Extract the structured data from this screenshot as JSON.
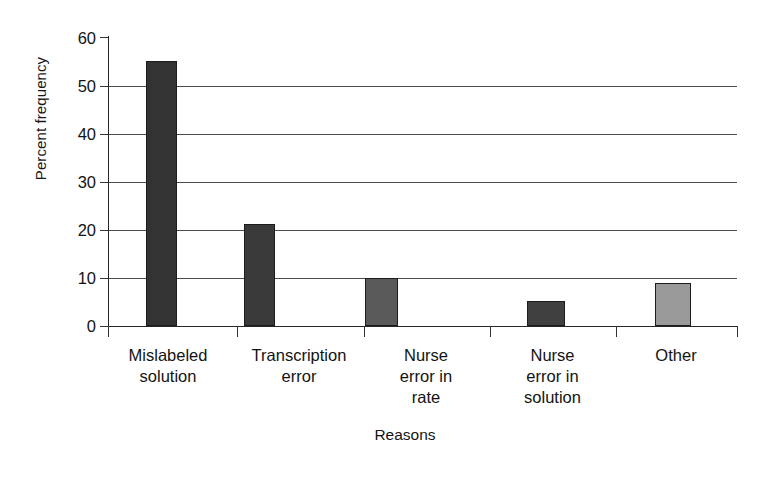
{
  "chart_data": {
    "type": "bar",
    "title": "",
    "xlabel": "Reasons",
    "ylabel": "Percent frequency",
    "categories": [
      "Mislabeled solution",
      "Transcription error",
      "Nurse error in rate",
      "Nurse error in solution",
      "Other"
    ],
    "category_lines": [
      [
        "Mislabeled",
        "solution"
      ],
      [
        "Transcription",
        "error"
      ],
      [
        "Nurse",
        "error in",
        "rate"
      ],
      [
        "Nurse",
        "error in",
        "solution"
      ],
      [
        "Other"
      ]
    ],
    "values": [
      55,
      21.2,
      10,
      5.1,
      9
    ],
    "ylim": [
      0,
      60
    ],
    "yticks": [
      60,
      50,
      40,
      30,
      20,
      10,
      0
    ],
    "ytick_labels": [
      "60",
      "50",
      "40",
      "30",
      "20",
      "10",
      "0"
    ],
    "grid": true,
    "grid_axis": "y",
    "legend": "none",
    "bar_colors": [
      "#333333",
      "#3a3a3a",
      "#5a5a5a",
      "#404040",
      "#9a9a9a"
    ],
    "bar_border_color": "#1c1c1c",
    "background_color": "#ffffff",
    "axis_color": "#262626"
  }
}
